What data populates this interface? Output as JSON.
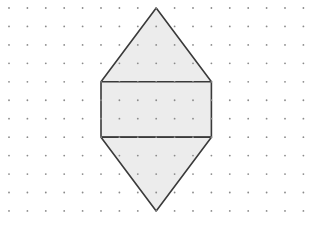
{
  "diagram": {
    "type": "dot-grid geometric figure",
    "grid": {
      "columns": 17,
      "rows": 12,
      "origin_x": 9,
      "origin_y": 8,
      "spacing_x": 18.4,
      "spacing_y": 18.45,
      "dot_color": "#8a8a8a",
      "dot_radius": 0.9
    },
    "figure": {
      "fill": "#ececec",
      "stroke": "#3a3a3a",
      "stroke_width": 1.6,
      "top_triangle": {
        "apex": [
          8,
          0
        ],
        "base_left": [
          5,
          4
        ],
        "base_right": [
          11,
          4
        ]
      },
      "rectangle": {
        "top_left": [
          5,
          4
        ],
        "bottom_right": [
          11,
          7
        ]
      },
      "bottom_triangle": {
        "apex": [
          8,
          11
        ],
        "base_left": [
          5,
          7
        ],
        "base_right": [
          11,
          7
        ]
      }
    }
  }
}
